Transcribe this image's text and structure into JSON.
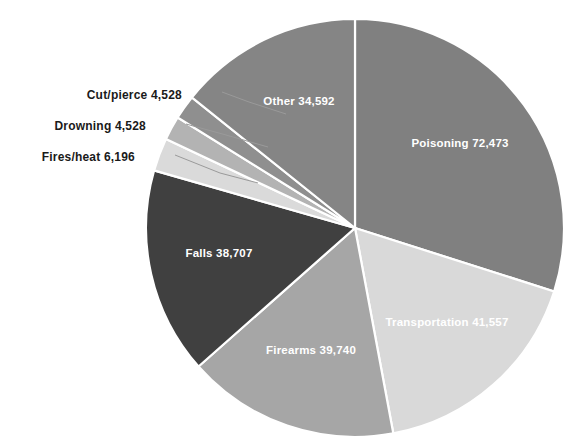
{
  "chart_data": {
    "type": "pie",
    "title": "",
    "subtitle": "",
    "xlabel": "",
    "ylabel": "",
    "legend_position": "none",
    "grid": false,
    "total": 242321,
    "start_angle_deg": 0,
    "direction": "clockwise",
    "categories": [
      "Poisoning",
      "Transportation",
      "Firearms",
      "Falls",
      "Fires/heat",
      "Drowning",
      "Cut/pierce",
      "Other"
    ],
    "values": [
      72473,
      41557,
      39740,
      38707,
      6196,
      4528,
      4528,
      34592
    ],
    "slices": [
      {
        "name": "Poisoning",
        "label": "Poisoning  72,473",
        "value": 72473,
        "value_text": "72,473",
        "color": "#808080",
        "label_placement": "inside",
        "label_color": "#ffffff",
        "start_deg": 0,
        "sweep_deg": 107.68,
        "label_x": 460,
        "label_y": 143
      },
      {
        "name": "Transportation",
        "label": "Transportation  41,557",
        "value": 41557,
        "value_text": "41,557",
        "color": "#d9d9d9",
        "label_placement": "inside",
        "label_color": "#ffffff",
        "start_deg": 107.68,
        "sweep_deg": 61.75,
        "label_x": 447,
        "label_y": 322
      },
      {
        "name": "Firearms",
        "label": "Firearms  39,740",
        "value": 39740,
        "value_text": "39,740",
        "color": "#a6a6a6",
        "label_placement": "inside",
        "label_color": "#ffffff",
        "start_deg": 169.43,
        "sweep_deg": 59.05,
        "label_x": 311,
        "label_y": 350
      },
      {
        "name": "Falls",
        "label": "Falls  38,707",
        "value": 38707,
        "value_text": "38,707",
        "color": "#404040",
        "label_placement": "inside",
        "label_color": "#ffffff",
        "start_deg": 228.48,
        "sweep_deg": 57.51,
        "label_x": 219,
        "label_y": 253
      },
      {
        "name": "Fires/heat",
        "label": "Fires/heat  6,196",
        "value": 6196,
        "value_text": "6,196",
        "color": "#dadada",
        "label_placement": "outside",
        "label_color": "#1a1a1a",
        "start_deg": 285.99,
        "sweep_deg": 9.21,
        "label_x": 135,
        "label_y": 157
      },
      {
        "name": "Drowning",
        "label": "Drowning  4,528",
        "value": 4528,
        "value_text": "4,528",
        "color": "#b3b3b3",
        "label_placement": "outside",
        "label_color": "#1a1a1a",
        "start_deg": 295.2,
        "sweep_deg": 6.73,
        "label_x": 146,
        "label_y": 126
      },
      {
        "name": "Cut/pierce",
        "label": "Cut/pierce  4,528",
        "value": 4528,
        "value_text": "4,528",
        "color": "#8f8f8f",
        "label_placement": "outside",
        "label_color": "#1a1a1a",
        "start_deg": 301.93,
        "sweep_deg": 6.73,
        "label_x": 182,
        "label_y": 95
      },
      {
        "name": "Other",
        "label": "Other  34,592",
        "value": 34592,
        "value_text": "34,592",
        "color": "#858585",
        "label_placement": "inside",
        "label_color": "#ffffff",
        "start_deg": 308.66,
        "sweep_deg": 51.34,
        "label_x": 299,
        "label_y": 101
      }
    ],
    "geometry": {
      "center_x": 355,
      "center_y": 228,
      "radius": 209
    },
    "leader_lines": [
      {
        "name": "cut-pierce",
        "x1": 222,
        "y1": 92,
        "x2": 249,
        "y2": 102,
        "x3": 286,
        "y3": 114
      },
      {
        "name": "drowning",
        "x1": 186,
        "y1": 124,
        "x2": 226,
        "y2": 135,
        "x3": 268,
        "y3": 147
      },
      {
        "name": "fires-heat",
        "x1": 175,
        "y1": 155,
        "x2": 220,
        "y2": 173,
        "x3": 258,
        "y3": 183
      }
    ]
  }
}
